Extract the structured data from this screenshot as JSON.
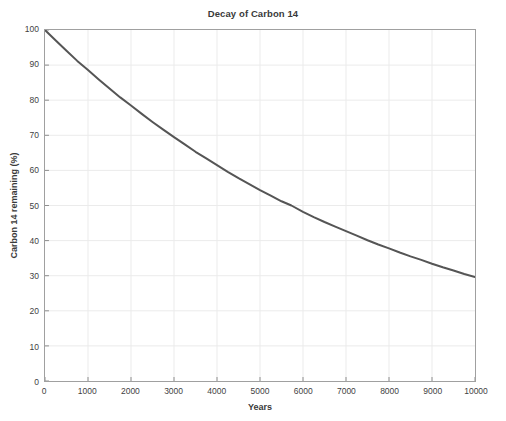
{
  "chart_data": {
    "type": "line",
    "title": "Decay of Carbon 14",
    "xlabel": "Years",
    "ylabel": "Carbon 14 remaining (%)",
    "xlim": [
      0,
      10000
    ],
    "ylim": [
      0,
      100
    ],
    "xticks": [
      0,
      1000,
      2000,
      3000,
      4000,
      5000,
      6000,
      7000,
      8000,
      9000,
      10000
    ],
    "xtick_labels": [
      "0",
      "1000",
      "2000",
      "3000",
      "4000",
      "5000",
      "6000",
      "7000",
      "8000",
      "9000",
      "10000"
    ],
    "yticks": [
      0,
      10,
      20,
      30,
      40,
      50,
      60,
      70,
      80,
      90,
      100
    ],
    "ytick_labels": [
      "0",
      "10",
      "20",
      "30",
      "40",
      "50",
      "60",
      "70",
      "80",
      "90",
      "100"
    ],
    "grid": true,
    "legend": null,
    "half_life_years": 5730,
    "series": [
      {
        "name": "Carbon 14 remaining",
        "color": "#555555",
        "line_width": 2,
        "x": [
          0,
          250,
          500,
          750,
          1000,
          1250,
          1500,
          1750,
          2000,
          2250,
          2500,
          2750,
          3000,
          3250,
          3500,
          3750,
          4000,
          4250,
          4500,
          4750,
          5000,
          5250,
          5500,
          5730,
          6000,
          6250,
          6500,
          6750,
          7000,
          7250,
          7500,
          7750,
          8000,
          8250,
          8500,
          8750,
          9000,
          9250,
          9500,
          9750,
          10000
        ],
        "values": [
          100.0,
          97.0,
          94.1,
          91.2,
          88.6,
          85.9,
          83.3,
          80.8,
          78.5,
          76.1,
          73.8,
          71.6,
          69.5,
          67.4,
          65.3,
          63.4,
          61.5,
          59.6,
          57.8,
          56.1,
          54.4,
          52.8,
          51.2,
          50.0,
          48.2,
          46.7,
          45.3,
          44.0,
          42.7,
          41.4,
          40.1,
          38.9,
          37.8,
          36.6,
          35.5,
          34.5,
          33.4,
          32.4,
          31.5,
          30.5,
          29.6
        ]
      }
    ],
    "colors": {
      "curve": "#555555",
      "grid": "#ebebeb",
      "axis": "#a0a0a0",
      "background": "#ffffff",
      "text": "#3a3a3a"
    }
  }
}
